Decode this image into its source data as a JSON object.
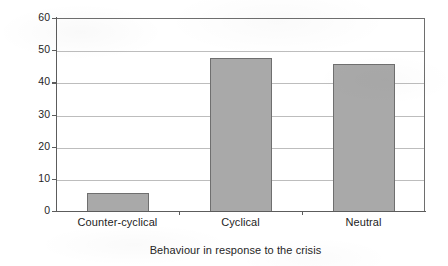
{
  "chart_data": {
    "type": "bar",
    "title": "",
    "subtitle": "",
    "categories": [
      "Counter-cyclical",
      "Cyclical",
      "Neutral"
    ],
    "values": [
      6,
      48,
      46
    ],
    "series": [
      {
        "name": "Percentage",
        "values": [
          6,
          48,
          46
        ]
      }
    ],
    "xlabel": "Behaviour in response to the crisis",
    "ylabel": "Percentage",
    "ylim": [
      0,
      60
    ],
    "yticks": [
      0,
      10,
      20,
      30,
      40,
      50,
      60
    ],
    "ytick_labels": [
      "0",
      "10",
      "20",
      "30",
      "40",
      "50",
      "60"
    ],
    "grid": true,
    "grid_axis": "y",
    "legend": false,
    "legend_position": "none",
    "bar_color": "#a9a9a9",
    "bar_edge_color": "#6f6f6f",
    "grid_color": "#bdbdbd",
    "axis_color": "#5c5c5c",
    "background_color": "#ffffff",
    "annotations": []
  }
}
